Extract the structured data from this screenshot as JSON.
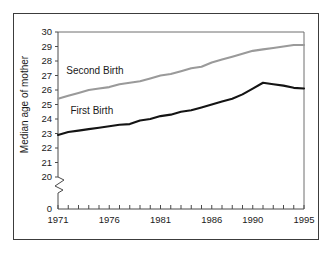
{
  "chart_data": {
    "type": "line",
    "title": "",
    "xlabel": "",
    "ylabel": "Median age of mother",
    "xlim": [
      1971,
      1995
    ],
    "ylim": [
      20,
      30
    ],
    "y_axis_break": true,
    "y_break_from": 0,
    "y_break_to": 20,
    "grid": false,
    "legend_position": "inline-annotation",
    "x_tick_labels": [
      "1971",
      "1976",
      "1981",
      "1986",
      "1990",
      "1995"
    ],
    "x_tick_label_years": [
      1971,
      1976,
      1981,
      1986,
      1990,
      1995
    ],
    "x_minor_tick_years": [
      1971,
      1972,
      1973,
      1974,
      1975,
      1976,
      1977,
      1978,
      1979,
      1980,
      1981,
      1982,
      1983,
      1984,
      1985,
      1986,
      1987,
      1988,
      1989,
      1990,
      1991,
      1992,
      1993,
      1994,
      1995
    ],
    "y_tick_labels": [
      "0",
      "20",
      "21",
      "22",
      "23",
      "24",
      "25",
      "26",
      "27",
      "28",
      "29",
      "30"
    ],
    "y_tick_values": [
      20,
      21,
      22,
      23,
      24,
      25,
      26,
      27,
      28,
      29,
      30
    ],
    "y_zero_label": "0",
    "x": [
      1971,
      1972,
      1973,
      1974,
      1975,
      1976,
      1977,
      1978,
      1979,
      1980,
      1981,
      1982,
      1983,
      1984,
      1985,
      1986,
      1987,
      1988,
      1989,
      1990,
      1991,
      1992,
      1993,
      1994,
      1995
    ],
    "series": [
      {
        "name": "Second Birth",
        "label": "Second Birth",
        "color": "#9a9a9a",
        "values": [
          25.4,
          25.6,
          25.8,
          26.0,
          26.1,
          26.2,
          26.4,
          26.5,
          26.6,
          26.8,
          27.0,
          27.1,
          27.3,
          27.5,
          27.6,
          27.9,
          28.1,
          28.3,
          28.5,
          28.7,
          28.8,
          28.9,
          29.0,
          29.1,
          29.1
        ]
      },
      {
        "name": "First Birth",
        "label": "First Birth",
        "color": "#141414",
        "values": [
          22.9,
          23.1,
          23.2,
          23.3,
          23.4,
          23.5,
          23.6,
          23.65,
          23.9,
          24.0,
          24.2,
          24.3,
          24.5,
          24.6,
          24.8,
          25.0,
          25.2,
          25.4,
          25.7,
          26.1,
          26.5,
          26.4,
          26.3,
          26.15,
          26.1
        ]
      }
    ],
    "annotations": [
      {
        "text": "Second Birth",
        "x_value": 1974.6,
        "y_value": 27.1
      },
      {
        "text": "First Birth",
        "x_value": 1974.3,
        "y_value": 24.35
      }
    ]
  }
}
